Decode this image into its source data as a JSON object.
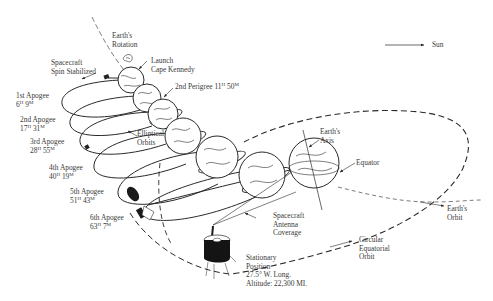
{
  "diagram": {
    "type": "technical-illustration",
    "colors": {
      "ink": "#2a2a2a",
      "text": "#3a3a3a",
      "background": "#ffffff"
    },
    "labels": {
      "sun": "Sun",
      "earths_rotation": [
        "Earth's",
        "Rotation"
      ],
      "launch": [
        "Launch",
        "Cape Kennedy"
      ],
      "spin_stabilized": [
        "Spacecraft",
        "Spin Stabilized"
      ],
      "perigee_2": {
        "text": "2nd Perigree 11",
        "h": "H",
        "min": "50",
        "m": "M"
      },
      "apogee_1": {
        "title": "1st Apogee",
        "hours": "6",
        "h": "H",
        "min": "9",
        "m": "M"
      },
      "apogee_2": {
        "title": "2nd Apogee",
        "hours": "17",
        "h": "H",
        "min": "31",
        "m": "M"
      },
      "apogee_3": {
        "title": "3rd Apogee",
        "hours": "28",
        "h": "H",
        "min": "55",
        "m": "M"
      },
      "apogee_4": {
        "title": "4th Apogee",
        "hours": "40",
        "h": "H",
        "min": "19",
        "m": "M"
      },
      "apogee_5": {
        "title": "5th Apogee",
        "hours": "51",
        "h": "H",
        "min": "43",
        "m": "M"
      },
      "apogee_6": {
        "title": "6th Apogee",
        "hours": "63",
        "h": "H",
        "min": "7",
        "m": "M"
      },
      "elliptical_orbits": [
        "Elliptical",
        "Orbits"
      ],
      "earths_axis": [
        "Earth's",
        "Axis"
      ],
      "equator": "Equator",
      "antenna_coverage": [
        "Spacecraft",
        "Antenna",
        "Coverage"
      ],
      "earths_orbit": [
        "Earth's",
        "Orbit"
      ],
      "circular_orbit": [
        "Circular",
        "Equatorial",
        "Orbit"
      ],
      "stationary": [
        "Stationary",
        "Position",
        "27.5° W. Long.",
        "Altitude: 22,300 MI."
      ]
    }
  }
}
